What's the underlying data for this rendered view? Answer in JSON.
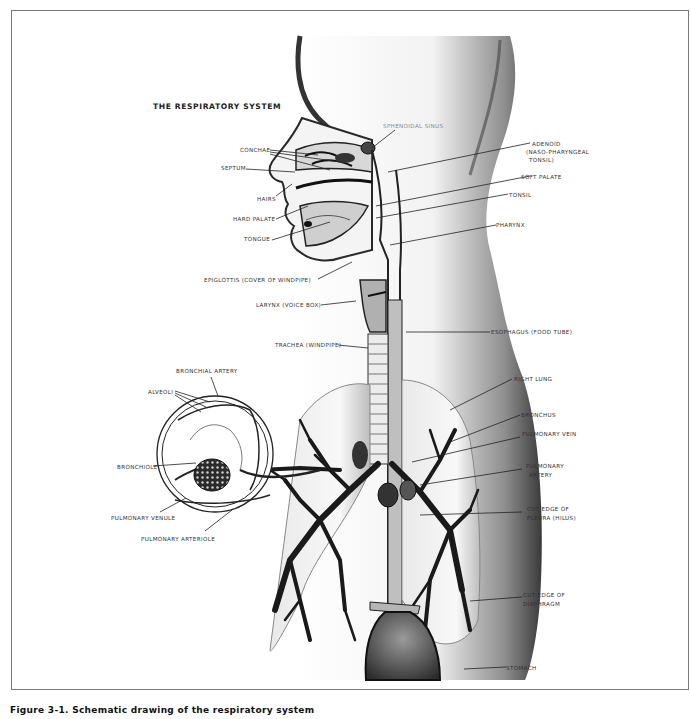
{
  "figure": {
    "title": "THE RESPIRATORY SYSTEM",
    "caption": "Figure 3-1.  Schematic drawing of the respiratory system"
  },
  "labels": {
    "conchae": "CONCHAE",
    "septum": "SEPTUM",
    "hairs": "HAIRS",
    "hard_palate": "HARD PALATE",
    "tongue": "TONGUE",
    "sphenoidal_sinus": "SPHENOIDAL SINUS",
    "adenoid_1": "ADENOID",
    "adenoid_2": "(NASO-PHARYNGEAL",
    "adenoid_3": "TONSIL)",
    "soft_palate": "SOFT PALATE",
    "tonsil": "TONSIL",
    "pharynx": "PHARYNX",
    "epiglottis": "EPIGLOTTIS (COVER OF WINDPIPE)",
    "larynx": "LARYNX (VOICE BOX)",
    "esophagus": "ESOPHAGUS (FOOD TUBE)",
    "trachea": "TRACHEA (WINDPIPE)",
    "bronchial_artery": "BRONCHIAL ARTERY",
    "alveoli": "ALVEOLI",
    "bronchiole": "BRONCHIOLE",
    "pulmonary_venule": "PULMONARY VENULE",
    "pulmonary_arteriole": "PULMONARY ARTERIOLE",
    "right_lung": "RIGHT LUNG",
    "bronchus": "BRONCHUS",
    "pulmonary_vein": "PULMONARY VEIN",
    "pulmonary_artery_1": "PULMONARY",
    "pulmonary_artery_2": "ARTERY",
    "cut_edge_pleura_1": "CUT EDGE OF",
    "cut_edge_pleura_2": "PLEURA (HILUS)",
    "cut_edge_diaphragm_1": "CUT EDGE OF",
    "cut_edge_diaphragm_2": "DIAPHRAGM",
    "stomach": "STOMACH"
  },
  "colors": {
    "ink": "#1e1e1e",
    "shade": "#555555",
    "frame": "#7a7a7a",
    "paper": "#ffffff"
  }
}
